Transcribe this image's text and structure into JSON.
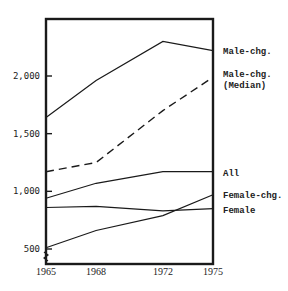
{
  "chart_data": {
    "type": "line",
    "title": "",
    "xlabel": "",
    "ylabel": "",
    "x": [
      1965,
      1968,
      1972,
      1975
    ],
    "x_tick_labels": [
      "1965",
      "1968",
      "1972",
      "1975"
    ],
    "y_tick_values": [
      500,
      1000,
      1500,
      2000
    ],
    "y_tick_labels": [
      "500",
      "1,000",
      "1,500",
      "2,000"
    ],
    "ylim": [
      400,
      2520
    ],
    "xlim": [
      1965,
      1975
    ],
    "grid": false,
    "legend_position": "right (inline labels at line ends)",
    "series": [
      {
        "name": "Male-chg.",
        "label_lines": [
          "Male-chg."
        ],
        "style": "solid",
        "values": [
          1640,
          1960,
          2300,
          2220
        ]
      },
      {
        "name": "Male-chg. (Median)",
        "label_lines": [
          "Male-chg.",
          "(Median)"
        ],
        "style": "dashed",
        "values": [
          1170,
          1250,
          1700,
          1990
        ]
      },
      {
        "name": "All",
        "label_lines": [
          "All"
        ],
        "style": "solid",
        "values": [
          940,
          1070,
          1170,
          1170
        ]
      },
      {
        "name": "Female-chg.",
        "label_lines": [
          "Female-chg."
        ],
        "style": "solid",
        "values": [
          510,
          660,
          790,
          970
        ]
      },
      {
        "name": "Female",
        "label_lines": [
          "Female"
        ],
        "style": "solid",
        "values": [
          860,
          870,
          830,
          850
        ]
      }
    ]
  },
  "colors": {
    "line": "#1a1a1a",
    "background": "#ffffff"
  }
}
